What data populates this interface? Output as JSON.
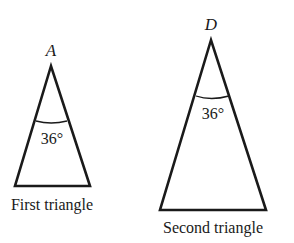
{
  "figures": [
    {
      "id": "first",
      "vertex_label": "A",
      "angle_label": "36°",
      "caption": "First triangle"
    },
    {
      "id": "second",
      "vertex_label": "D",
      "angle_label": "36°",
      "caption": "Second triangle"
    }
  ],
  "style": {
    "stroke_color": "#1a1a1a",
    "background": "#ffffff"
  }
}
